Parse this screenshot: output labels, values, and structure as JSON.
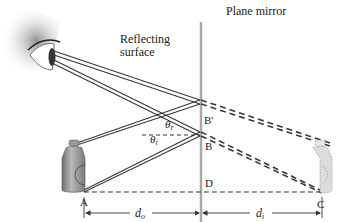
{
  "title": "Plane mirror",
  "surface_label_line1": "Reflecting",
  "surface_label_line2": "surface",
  "points": {
    "A": "A",
    "B": "B",
    "B_prime": "B′",
    "C": "C",
    "D": "D"
  },
  "angles": {
    "theta_r": "θ",
    "theta_r_sub": "r",
    "theta_i": "θ",
    "theta_i_sub": "i"
  },
  "distances": {
    "d_o": "d",
    "d_o_sub": "o",
    "d_i": "d",
    "d_i_sub": "i"
  },
  "colors": {
    "mirror": "#a9a9a9",
    "ray": "#3a3a3a",
    "bottle": "#9a9a9a",
    "image_bottle": "#dcdcdc"
  }
}
